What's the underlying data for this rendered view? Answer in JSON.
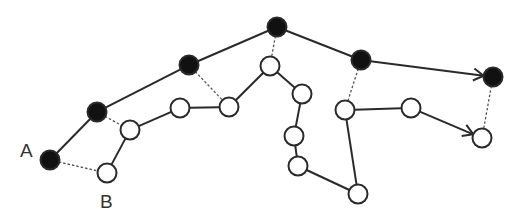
{
  "labels": {
    "a": "A",
    "b": "B"
  },
  "colors": {
    "stroke": "#2a2a2a",
    "filled": "#111111",
    "hollow": "#ffffff",
    "dashed": "#555555"
  },
  "top_path": {
    "node_style": "filled",
    "nodes": [
      [
        50,
        160
      ],
      [
        97,
        112
      ],
      [
        189,
        65
      ],
      [
        277,
        27
      ],
      [
        361,
        60
      ],
      [
        493,
        77
      ]
    ],
    "end_arrow": true
  },
  "bottom_path": {
    "node_style": "hollow",
    "nodes": [
      [
        107,
        173
      ],
      [
        130,
        130
      ],
      [
        180,
        108
      ],
      [
        229,
        107
      ],
      [
        270,
        66
      ],
      [
        302,
        94
      ],
      [
        294,
        136
      ],
      [
        298,
        166
      ],
      [
        358,
        194
      ],
      [
        345,
        110
      ],
      [
        411,
        108
      ],
      [
        482,
        138
      ]
    ],
    "end_arrow": true
  },
  "correspondences": [
    [
      0,
      0
    ],
    [
      1,
      1
    ],
    [
      2,
      3
    ],
    [
      3,
      4
    ],
    [
      4,
      9
    ],
    [
      5,
      11
    ]
  ]
}
